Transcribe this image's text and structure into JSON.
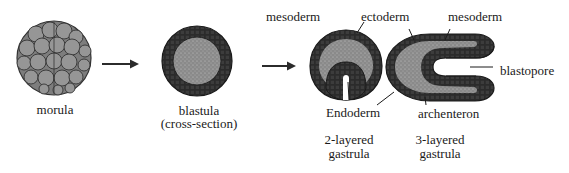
{
  "stages": {
    "morula": {
      "label": "morula"
    },
    "blastula": {
      "label": "blastula",
      "sublabel": "(cross-section)"
    },
    "gastrula_2": {
      "label_line1": "2-layered",
      "label_line2": "gastrula"
    },
    "gastrula_3": {
      "label_line1": "3-layered",
      "label_line2": "gastrula"
    }
  },
  "annotations": {
    "mesoderm_left": "mesoderm",
    "ectoderm": "ectoderm",
    "mesoderm_right": "mesoderm",
    "blastopore": "blastopore",
    "endoderm": "Endoderm",
    "archenteron": "archenteron"
  },
  "colors": {
    "outer_cell_layer": "#2b2b2b",
    "inner_fill": "#8a8a8a",
    "morula_cell": "#8c8c8c",
    "text": "#1a1a1a"
  }
}
